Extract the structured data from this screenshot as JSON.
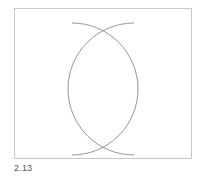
{
  "figure": {
    "caption": "2.13",
    "frame_color": "#c8c8c8",
    "stroke_color": "#8a8a8a",
    "arcs": [
      {
        "name": "left-centered-arc",
        "d": "M72,23 A66,66 0 0 1 72,155"
      },
      {
        "name": "right-centered-arc",
        "d": "M134,23 A66,66 0 0 0 134,155"
      }
    ]
  }
}
